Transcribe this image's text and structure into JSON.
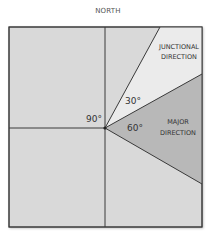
{
  "diagram": {
    "north_label": "NORTH",
    "angles": {
      "right_angle": "90°",
      "junctional_angle": "30°",
      "major_angle": "60°"
    },
    "regions": {
      "junctional": [
        "JUNCTIONAL",
        "DIRECTION"
      ],
      "major": [
        "MAJOR",
        "DIRECTION"
      ]
    },
    "colors": {
      "background_fill": "#d9d9d9",
      "junctional_fill": "#ebebeb",
      "major_fill": "#b8b8b8",
      "line": "#3a3a3a"
    }
  }
}
